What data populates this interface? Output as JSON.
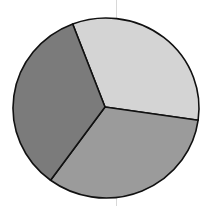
{
  "chart_data": {
    "type": "pie",
    "title": "",
    "labels": [
      "Slice A",
      "Slice B",
      "Slice C"
    ],
    "values": [
      33,
      33,
      34
    ],
    "colors": [
      "#d4d4d4",
      "#9b9b9b",
      "#7b7b7b"
    ],
    "start_angle_deg": 339,
    "direction": "clockwise",
    "legend": "none",
    "outline_color": "#111111"
  },
  "geometry": {
    "cx": 106,
    "cy": 108,
    "rx": 93,
    "ry": 90,
    "hub_x": 105,
    "hub_y": 107
  }
}
